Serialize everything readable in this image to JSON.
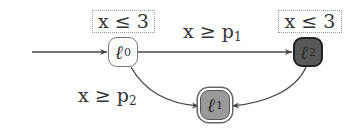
{
  "diagram": {
    "type": "timed-automaton",
    "initial_state": "l0",
    "nodes": [
      {
        "id": "l0",
        "symbol": "ℓ",
        "index": "0",
        "fill": "#ffffff",
        "style": "normal",
        "invariant": "x ≤ 3"
      },
      {
        "id": "l1",
        "symbol": "ℓ",
        "index": "1",
        "fill": "#9a9a9a",
        "style": "double-border",
        "invariant": ""
      },
      {
        "id": "l2",
        "symbol": "ℓ",
        "index": "2",
        "fill": "#595959",
        "style": "dark",
        "invariant": "x ≤ 3"
      }
    ],
    "edges": [
      {
        "from": "init",
        "to": "l0",
        "label": ""
      },
      {
        "from": "l0",
        "to": "l2",
        "label_var": "x ≥ p",
        "label_sub": "1"
      },
      {
        "from": "l0",
        "to": "l1",
        "label_var": "x ≥ p",
        "label_sub": "2"
      },
      {
        "from": "l2",
        "to": "l1",
        "label": ""
      }
    ]
  }
}
